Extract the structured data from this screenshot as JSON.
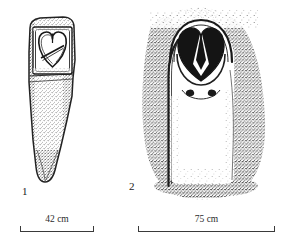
{
  "plate": {
    "type": "archaeological-line-drawing-plate",
    "background_color": "#ffffff",
    "ink_color": "#1a1a1a",
    "figure_count": 2
  },
  "figures": [
    {
      "number": "1",
      "subject": "engraved stele with heart-shaped owl-face motif",
      "rendering": "stippled line drawing",
      "scale": {
        "label": "42 cm",
        "value": 42,
        "unit": "cm"
      }
    },
    {
      "number": "2",
      "subject": "rock-art owl figure with heart-shaped facial disc and two dots",
      "rendering": "stippled shading around white figure",
      "scale": {
        "label": "75 cm",
        "value": 75,
        "unit": "cm"
      }
    }
  ]
}
